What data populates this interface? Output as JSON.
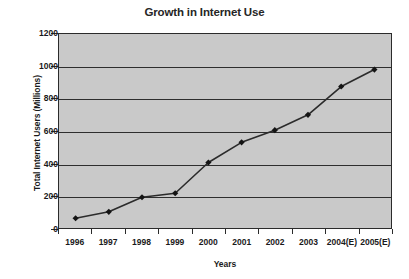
{
  "chart_data": {
    "type": "line",
    "title": "Growth in Internet Use",
    "xlabel": "Years",
    "ylabel": "Total Internet Users (Millions)",
    "categories": [
      "1996",
      "1997",
      "1998",
      "1999",
      "2000",
      "2001",
      "2002",
      "2003",
      "2004(E)",
      "2005(E)"
    ],
    "values": [
      60,
      100,
      190,
      215,
      405,
      530,
      605,
      700,
      875,
      980
    ],
    "series": [
      {
        "name": "Total Internet Users (Millions)",
        "values": [
          60,
          100,
          190,
          215,
          405,
          530,
          605,
          700,
          875,
          980
        ]
      }
    ],
    "ylim": [
      0,
      1200
    ],
    "ytick_labels": [
      "0",
      "200",
      "400",
      "600",
      "800",
      "1000",
      "1200"
    ],
    "ytick_values": [
      0,
      200,
      400,
      600,
      800,
      1000,
      1200
    ],
    "grid": "horizontal",
    "legend": "none",
    "colors": {
      "plot_background": "#c9c9c9",
      "line": "#2b2b2b",
      "marker": "#141414",
      "gridline": "#2e2e2e",
      "axis": "#2b2b2b",
      "text": "#1a1a1a",
      "figure_background": "#ffffff"
    },
    "marker": "diamond"
  }
}
